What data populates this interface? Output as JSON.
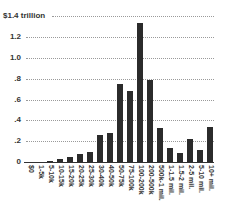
{
  "chart_data": {
    "type": "bar",
    "title": "",
    "xlabel": "",
    "ylabel": "",
    "ylim": [
      0,
      1.4
    ],
    "grid": true,
    "yticks": [
      {
        "value": 0,
        "label": "0"
      },
      {
        "value": 0.2,
        "label": ".2"
      },
      {
        "value": 0.4,
        "label": ".4"
      },
      {
        "value": 0.6,
        "label": ".6"
      },
      {
        "value": 0.8,
        "label": ".8"
      },
      {
        "value": 1.0,
        "label": "1.0"
      },
      {
        "value": 1.2,
        "label": "1.2"
      },
      {
        "value": 1.4,
        "label": "$1.4 trillion"
      }
    ],
    "categories": [
      "$0",
      "1-5k",
      "5-10k",
      "10-15k",
      "15-20k",
      "20-25k",
      "25-30k",
      "30-40k",
      "40-50k",
      "50-75k",
      "75-100k",
      "100-200k",
      "200-500k",
      "500k-1 mil.",
      "1-1.5 mil.",
      "1.5-2 mil.",
      "2-5 mil.",
      "5-10 mil.",
      "10+ mil."
    ],
    "values": [
      0.0,
      0.003,
      0.01,
      0.03,
      0.05,
      0.08,
      0.1,
      0.26,
      0.28,
      0.75,
      0.68,
      1.34,
      0.79,
      0.33,
      0.13,
      0.085,
      0.22,
      0.115,
      0.34
    ],
    "bar_color": "#2b2b2b"
  }
}
